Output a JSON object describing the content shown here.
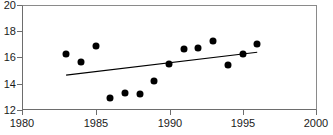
{
  "chart_data": {
    "type": "scatter",
    "title": "",
    "xlabel": "",
    "ylabel": "",
    "xlim": [
      1980,
      2000
    ],
    "ylim": [
      12,
      20
    ],
    "grid": false,
    "legend": null,
    "xticks": [
      1980,
      1985,
      1990,
      1995,
      2000
    ],
    "yticks": [
      12,
      14,
      16,
      18,
      20
    ],
    "series": [
      {
        "name": "observations",
        "marker": "filled-diamond",
        "color": "#000000",
        "x": [
          1983,
          1984,
          1985,
          1986,
          1987,
          1988,
          1989,
          1990,
          1991,
          1992,
          1993,
          1994,
          1995,
          1996
        ],
        "y": [
          16.3,
          15.65,
          16.85,
          12.95,
          13.3,
          13.2,
          14.2,
          15.5,
          16.65,
          16.75,
          17.25,
          15.4,
          16.25,
          17.05
        ]
      },
      {
        "name": "trend-line",
        "type": "line",
        "color": "#000000",
        "x": [
          1983,
          1996
        ],
        "y": [
          14.65,
          16.4
        ]
      }
    ]
  },
  "axes": {
    "y_tick_labels": [
      "20",
      "18",
      "16",
      "14",
      "12"
    ],
    "x_tick_labels": [
      "1980",
      "1985",
      "1990",
      "1995",
      "2000"
    ]
  },
  "title_sliver": {
    "text": ""
  }
}
